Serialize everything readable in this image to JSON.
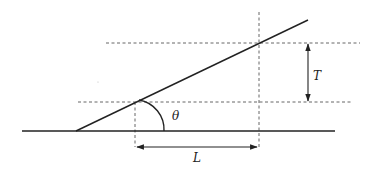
{
  "diagram": {
    "labels": {
      "theta": "θ",
      "thickness": "T",
      "length": "L"
    },
    "elements": {
      "base_line": {
        "x1": 22,
        "y1": 131,
        "x2": 335,
        "y2": 131
      },
      "incline_line": {
        "x1": 76,
        "y1": 131,
        "x2": 308,
        "y2": 20
      },
      "lower_dashed": {
        "x1": 78,
        "y1": 102,
        "x2": 352,
        "y2": 102
      },
      "upper_dashed": {
        "x1": 106,
        "y1": 43,
        "x2": 360,
        "y2": 43
      },
      "left_vertical_dashed": {
        "x1": 135,
        "y1": 102,
        "x2": 135,
        "y2": 147
      },
      "right_vertical_dashed": {
        "x1": 259,
        "y1": 12,
        "x2": 259,
        "y2": 148
      },
      "L_arrow": {
        "x1": 137,
        "y1": 147,
        "x2": 257,
        "y2": 147
      },
      "T_arrow": {
        "x1": 308,
        "y1": 44,
        "x2": 308,
        "y2": 101
      }
    },
    "colors": {
      "line": "#222222",
      "dashed": "#555555",
      "background": "#ffffff"
    }
  }
}
